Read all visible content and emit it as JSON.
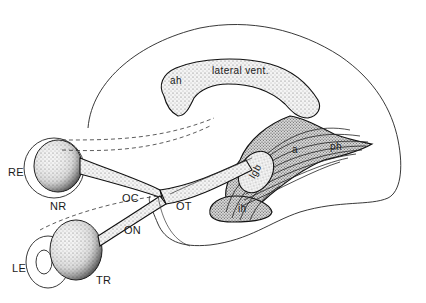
{
  "figure": {
    "labels": {
      "lateral_ventricle": "lateral vent.",
      "anterior_horn": "ah",
      "posterior_horn": "ph",
      "inferior_horn": "ih",
      "lateral_geniculate_body": "lgb",
      "radiation": "a",
      "right_eye": "RE",
      "left_eye": "LE",
      "nasal_retina": "NR",
      "temporal_retina": "TR",
      "optic_chiasm": "OC",
      "optic_nerve": "ON",
      "optic_tract": "OT"
    },
    "colors": {
      "ink": "#1a1a1a",
      "background": "#ffffff"
    }
  }
}
